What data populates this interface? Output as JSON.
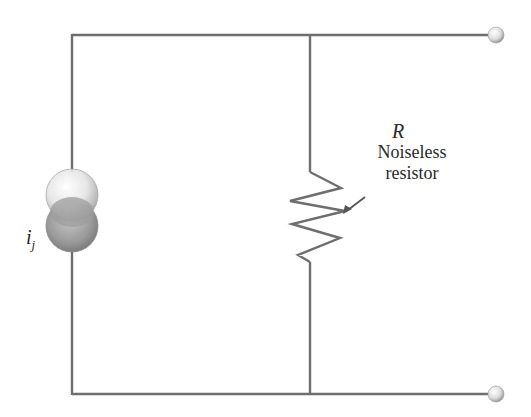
{
  "diagram": {
    "type": "circuit",
    "colors": {
      "wire": "#6e6e6e",
      "text": "#2a2a2a",
      "sphere_light": "#f4f4f4",
      "sphere_dark": "#8a8a8a"
    },
    "components": [
      {
        "id": "current-source",
        "kind": "noise current source",
        "label": "i",
        "subscript": "j"
      },
      {
        "id": "resistor",
        "kind": "resistor",
        "symbol": "R",
        "description_lines": [
          "Noiseless",
          "resistor"
        ]
      }
    ],
    "terminals": [
      {
        "id": "top-terminal"
      },
      {
        "id": "bottom-terminal"
      }
    ]
  },
  "labels": {
    "source_main": "i",
    "source_sub": "j",
    "resistor_symbol": "R",
    "resistor_line1": "Noiseless",
    "resistor_line2": "resistor"
  }
}
